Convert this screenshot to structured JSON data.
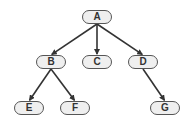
{
  "diagram": {
    "type": "tree",
    "nodes": [
      {
        "id": "A",
        "label": "A",
        "x": 97,
        "y": 17
      },
      {
        "id": "B",
        "label": "B",
        "x": 51,
        "y": 62
      },
      {
        "id": "C",
        "label": "C",
        "x": 97,
        "y": 62
      },
      {
        "id": "D",
        "label": "D",
        "x": 143,
        "y": 62
      },
      {
        "id": "E",
        "label": "E",
        "x": 29,
        "y": 108
      },
      {
        "id": "F",
        "label": "F",
        "x": 75,
        "y": 108
      },
      {
        "id": "G",
        "label": "G",
        "x": 165,
        "y": 108
      }
    ],
    "edges": [
      {
        "from": "A",
        "to": "B"
      },
      {
        "from": "A",
        "to": "C"
      },
      {
        "from": "A",
        "to": "D"
      },
      {
        "from": "B",
        "to": "E"
      },
      {
        "from": "B",
        "to": "F"
      },
      {
        "from": "D",
        "to": "G"
      }
    ],
    "colors": {
      "edge": "#333333",
      "node_fill": "#efefef",
      "node_border": "#555555"
    }
  }
}
